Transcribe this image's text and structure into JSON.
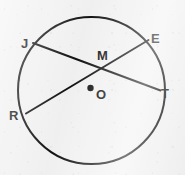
{
  "figure": {
    "background_color": "#f4f4f4",
    "stroke_color": "#111111",
    "label_color": "#111111"
  },
  "circle": {
    "name": "circle-O",
    "center_x": 91.5,
    "center_y": 90.5,
    "radius": 73.5,
    "stroke_width": 2.0
  },
  "center_point": {
    "label": "O",
    "dot_x": 90.5,
    "dot_y": 88.0,
    "dot_radius": 3.2,
    "label_x": 96,
    "label_y": 88
  },
  "intersection_point": {
    "label": "M",
    "x": 104.0,
    "y": 69.0,
    "label_x": 97,
    "label_y": 49
  },
  "chords": [
    {
      "name": "chord-JT",
      "from": "J",
      "to": "T",
      "x1": 33.0,
      "y1": 43.0,
      "x2": 160.5,
      "y2": 90.5,
      "stroke_width": 2.0
    },
    {
      "name": "chord-RE",
      "from": "R",
      "to": "E",
      "x1": 26.0,
      "y1": 113.5,
      "x2": 148.5,
      "y2": 40.0,
      "stroke_width": 2.0
    }
  ],
  "labels": [
    {
      "id": "J",
      "text": "J",
      "x": 21,
      "y": 37
    },
    {
      "id": "E",
      "text": "E",
      "x": 151,
      "y": 32
    },
    {
      "id": "M",
      "text": "M",
      "x": 97,
      "y": 49
    },
    {
      "id": "T",
      "text": "T",
      "x": 161,
      "y": 87
    },
    {
      "id": "O",
      "text": "O",
      "x": 96,
      "y": 88
    },
    {
      "id": "R",
      "text": "R",
      "x": 9,
      "y": 109
    }
  ]
}
